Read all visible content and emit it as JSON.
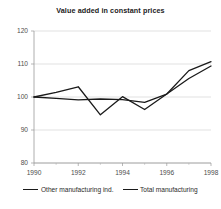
{
  "chart_data": {
    "type": "line",
    "title": "Value added in constant prices",
    "xlabel": "",
    "ylabel": "",
    "x": [
      1990,
      1991,
      1992,
      1993,
      1994,
      1995,
      1996,
      1997,
      1998
    ],
    "xticks": [
      1990,
      1992,
      1994,
      1996,
      1998
    ],
    "xtick_labels": [
      "1990",
      "1992",
      "1994",
      "1996",
      "1998"
    ],
    "yticks": [
      80,
      90,
      100,
      110,
      120
    ],
    "ytick_labels": [
      "80",
      "90",
      "100",
      "110",
      "120"
    ],
    "xlim": [
      1990,
      1998
    ],
    "ylim": [
      80,
      120
    ],
    "grid": true,
    "legend_position": "bottom",
    "series": [
      {
        "name": "Other manufacturing ind.",
        "color": "#1a1a1a",
        "values": [
          100.0,
          101.4,
          103.1,
          94.6,
          100.1,
          96.2,
          100.9,
          105.6,
          109.4
        ]
      },
      {
        "name": "Total manufacturing",
        "color": "#1a1a1a",
        "values": [
          100.0,
          99.6,
          99.1,
          99.4,
          99.2,
          98.4,
          100.9,
          108.0,
          110.7
        ]
      }
    ]
  },
  "legend": {
    "entries": [
      {
        "label": "Other manufacturing ind."
      },
      {
        "label": "Total manufacturing"
      }
    ]
  }
}
